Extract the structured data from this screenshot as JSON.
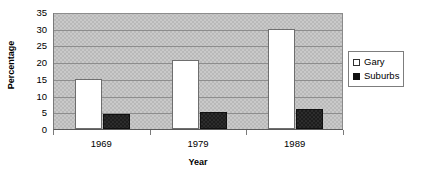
{
  "chart_data": {
    "type": "bar",
    "title": "",
    "subtitle": "",
    "xlabel": "Year",
    "ylabel": "Percentage",
    "categories": [
      "1969",
      "1979",
      "1989"
    ],
    "series": [
      {
        "name": "Gary",
        "values": [
          15,
          20.5,
          30
        ],
        "color": "#ffffff",
        "marker": "hollow-square"
      },
      {
        "name": "Suburbs",
        "values": [
          4.5,
          5,
          6
        ],
        "color": "#111111",
        "marker": "filled-square"
      }
    ],
    "ylim": [
      0,
      35
    ],
    "ytick_step": 5,
    "yticks": [
      0,
      5,
      10,
      15,
      20,
      25,
      30,
      35
    ],
    "ytick_labels": [
      "0",
      "5",
      "10",
      "15",
      "20",
      "25",
      "30",
      "35"
    ],
    "grid": "horizontal",
    "legend_position": "right",
    "plot_background": "#c9c9c9",
    "gridline_color": "#8d8d8d",
    "axis_color": "#5a5a5a"
  },
  "legend": {
    "entries": [
      {
        "label": "Gary"
      },
      {
        "label": "Suburbs"
      }
    ]
  }
}
